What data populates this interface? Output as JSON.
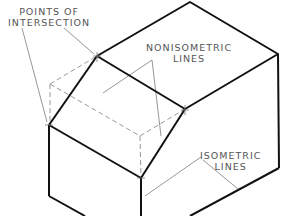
{
  "diagram": {
    "type": "isometric-drawing",
    "labels": {
      "points_of_intersection": {
        "line1": "POINTS OF",
        "line2": "INTERSECTION"
      },
      "nonisometric_lines": {
        "line1": "NONISOMETRIC",
        "line2": "LINES"
      },
      "isometric_lines": {
        "line1": "ISOMETRIC",
        "line2": "LINES"
      }
    },
    "colors": {
      "visible_edge": "#111111",
      "hidden_edge": "#999999",
      "leader": "#888888",
      "label": "#555555"
    }
  }
}
